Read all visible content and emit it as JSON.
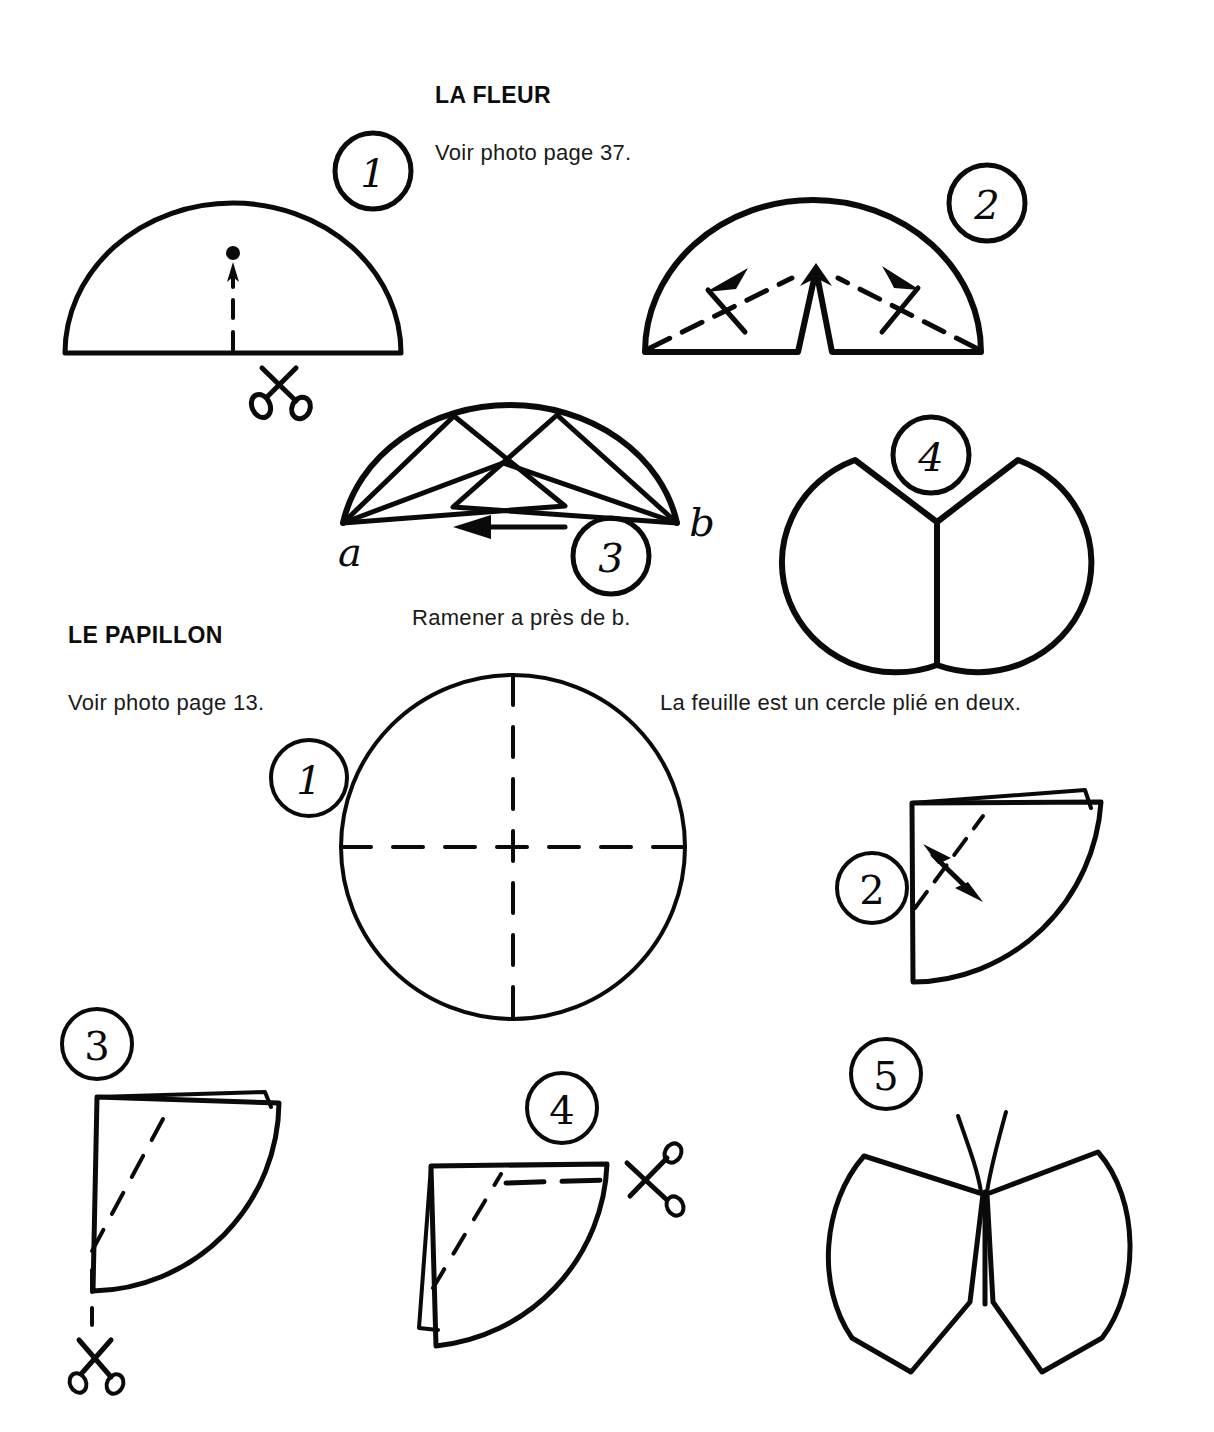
{
  "page": {
    "background": "#ffffff",
    "ink_color": "#0a0a0a",
    "width": 1214,
    "height": 1432
  },
  "sections": [
    {
      "id": "la-fleur",
      "title": "LA FLEUR",
      "photo_reference": "Voir photo page 37.",
      "instruction": "Ramener a près de b.",
      "steps": [
        {
          "number": "1",
          "label": "half-circle with cut line and scissors"
        },
        {
          "number": "2",
          "label": "notched half-circle with fold arrows"
        },
        {
          "number": "3",
          "label": "folded peaks, bring a near b"
        },
        {
          "number": "4",
          "label": "finished flower"
        }
      ],
      "point_labels": {
        "left": "a",
        "right": "b"
      }
    },
    {
      "id": "le-papillon",
      "title": "LE PAPILLON",
      "photo_reference": "Voir photo page 13.",
      "instruction": "La feuille est un cercle plié en deux.",
      "steps": [
        {
          "number": "1",
          "label": "circle with dashed fold axes"
        },
        {
          "number": "2",
          "label": "quarter fold with double arrow"
        },
        {
          "number": "3",
          "label": "quarter fold with cut line and scissors"
        },
        {
          "number": "4",
          "label": "quarter fold with horizontal cut and scissors"
        },
        {
          "number": "5",
          "label": "finished butterfly"
        }
      ]
    }
  ],
  "icons": {
    "scissors": "scissors-icon",
    "arrow": "arrow-icon",
    "dashed_fold": "dashed-fold-line"
  }
}
